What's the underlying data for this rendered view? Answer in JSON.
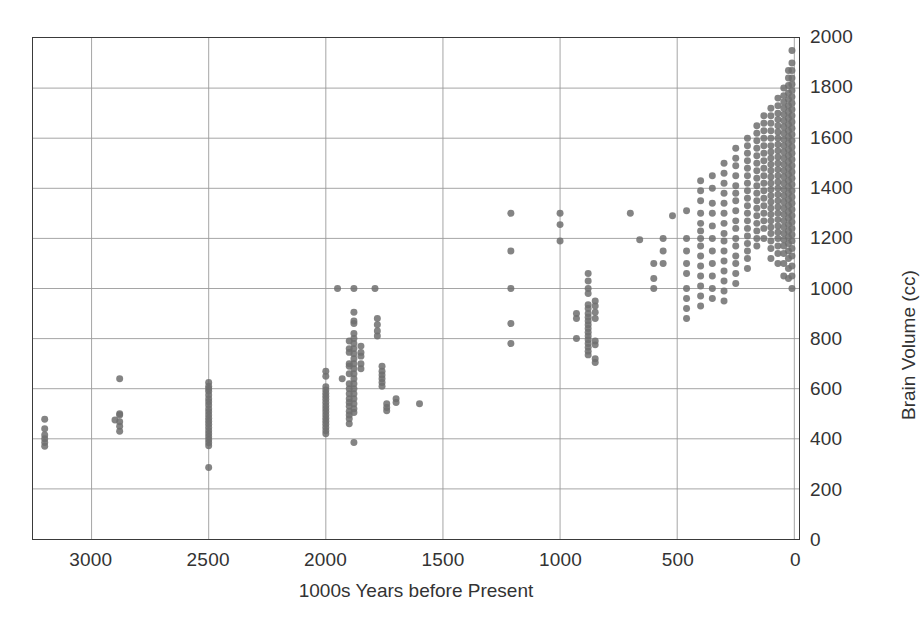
{
  "chart_data": {
    "type": "scatter",
    "title": "",
    "xlabel": "1000s Years before Present",
    "ylabel": "Brain Volume (cc)",
    "xlim": [
      3250,
      -20
    ],
    "ylim": [
      0,
      2000
    ],
    "x_reversed": true,
    "grid": true,
    "legend": "none",
    "marker": {
      "shape": "circle",
      "color": "#6f6f6f",
      "size_px": 7,
      "opacity": 0.85
    },
    "xticks": [
      3000,
      2500,
      2000,
      1500,
      1000,
      500,
      0
    ],
    "xtick_labels": [
      "3000",
      "2500",
      "2000",
      "1500",
      "1000",
      "500",
      "0"
    ],
    "yticks": [
      0,
      200,
      400,
      600,
      800,
      1000,
      1200,
      1400,
      1600,
      1800,
      2000
    ],
    "ytick_labels": [
      "0",
      "200",
      "400",
      "600",
      "800",
      "1000",
      "1200",
      "1400",
      "1600",
      "1800",
      "2000"
    ],
    "ytick_side": "right",
    "points": [
      [
        3200,
        400
      ],
      [
        3200,
        385
      ],
      [
        3200,
        370
      ],
      [
        3200,
        415
      ],
      [
        3200,
        440
      ],
      [
        3200,
        478
      ],
      [
        2900,
        475
      ],
      [
        2880,
        468
      ],
      [
        2880,
        500
      ],
      [
        2880,
        495
      ],
      [
        2880,
        450
      ],
      [
        2880,
        430
      ],
      [
        2880,
        640
      ],
      [
        2500,
        600
      ],
      [
        2500,
        590
      ],
      [
        2500,
        575
      ],
      [
        2500,
        560
      ],
      [
        2500,
        548
      ],
      [
        2500,
        535
      ],
      [
        2500,
        520
      ],
      [
        2500,
        508
      ],
      [
        2500,
        495
      ],
      [
        2500,
        482
      ],
      [
        2500,
        470
      ],
      [
        2500,
        458
      ],
      [
        2500,
        445
      ],
      [
        2500,
        432
      ],
      [
        2500,
        420
      ],
      [
        2500,
        408
      ],
      [
        2500,
        396
      ],
      [
        2500,
        384
      ],
      [
        2500,
        372
      ],
      [
        2500,
        610
      ],
      [
        2500,
        625
      ],
      [
        2500,
        285
      ],
      [
        2000,
        608
      ],
      [
        2000,
        595
      ],
      [
        2000,
        582
      ],
      [
        2000,
        570
      ],
      [
        2000,
        558
      ],
      [
        2000,
        545
      ],
      [
        2000,
        532
      ],
      [
        2000,
        520
      ],
      [
        2000,
        508
      ],
      [
        2000,
        495
      ],
      [
        2000,
        482
      ],
      [
        2000,
        470
      ],
      [
        2000,
        458
      ],
      [
        2000,
        445
      ],
      [
        2000,
        432
      ],
      [
        2000,
        420
      ],
      [
        2000,
        650
      ],
      [
        2000,
        670
      ],
      [
        1950,
        1000
      ],
      [
        1930,
        640
      ],
      [
        1900,
        760
      ],
      [
        1900,
        745
      ],
      [
        1900,
        700
      ],
      [
        1900,
        690
      ],
      [
        1900,
        660
      ],
      [
        1900,
        620
      ],
      [
        1900,
        600
      ],
      [
        1900,
        580
      ],
      [
        1900,
        560
      ],
      [
        1900,
        545
      ],
      [
        1900,
        530
      ],
      [
        1900,
        510
      ],
      [
        1900,
        495
      ],
      [
        1900,
        480
      ],
      [
        1900,
        460
      ],
      [
        1900,
        790
      ],
      [
        1880,
        1000
      ],
      [
        1880,
        905
      ],
      [
        1880,
        870
      ],
      [
        1880,
        820
      ],
      [
        1880,
        800
      ],
      [
        1880,
        780
      ],
      [
        1880,
        760
      ],
      [
        1880,
        740
      ],
      [
        1880,
        720
      ],
      [
        1880,
        700
      ],
      [
        1880,
        680
      ],
      [
        1880,
        660
      ],
      [
        1880,
        640
      ],
      [
        1880,
        620
      ],
      [
        1880,
        600
      ],
      [
        1880,
        580
      ],
      [
        1880,
        560
      ],
      [
        1880,
        540
      ],
      [
        1880,
        520
      ],
      [
        1880,
        505
      ],
      [
        1880,
        860
      ],
      [
        1880,
        385
      ],
      [
        1850,
        770
      ],
      [
        1850,
        745
      ],
      [
        1850,
        730
      ],
      [
        1850,
        700
      ],
      [
        1850,
        680
      ],
      [
        1790,
        1000
      ],
      [
        1780,
        880
      ],
      [
        1780,
        855
      ],
      [
        1780,
        830
      ],
      [
        1780,
        810
      ],
      [
        1760,
        690
      ],
      [
        1760,
        670
      ],
      [
        1760,
        655
      ],
      [
        1760,
        640
      ],
      [
        1760,
        625
      ],
      [
        1760,
        610
      ],
      [
        1740,
        540
      ],
      [
        1740,
        525
      ],
      [
        1740,
        512
      ],
      [
        1700,
        560
      ],
      [
        1700,
        545
      ],
      [
        1600,
        540
      ],
      [
        1210,
        1300
      ],
      [
        1210,
        1150
      ],
      [
        1210,
        1000
      ],
      [
        1210,
        860
      ],
      [
        1210,
        780
      ],
      [
        1000,
        1300
      ],
      [
        1000,
        1255
      ],
      [
        1000,
        1190
      ],
      [
        930,
        900
      ],
      [
        930,
        880
      ],
      [
        930,
        800
      ],
      [
        880,
        1000
      ],
      [
        880,
        980
      ],
      [
        880,
        935
      ],
      [
        880,
        920
      ],
      [
        880,
        900
      ],
      [
        880,
        885
      ],
      [
        880,
        870
      ],
      [
        880,
        855
      ],
      [
        880,
        840
      ],
      [
        880,
        825
      ],
      [
        880,
        810
      ],
      [
        880,
        795
      ],
      [
        880,
        780
      ],
      [
        880,
        765
      ],
      [
        880,
        750
      ],
      [
        880,
        735
      ],
      [
        880,
        1060
      ],
      [
        880,
        1030
      ],
      [
        850,
        950
      ],
      [
        850,
        930
      ],
      [
        850,
        905
      ],
      [
        850,
        880
      ],
      [
        850,
        790
      ],
      [
        850,
        775
      ],
      [
        850,
        720
      ],
      [
        850,
        705
      ],
      [
        700,
        1300
      ],
      [
        660,
        1195
      ],
      [
        600,
        1100
      ],
      [
        600,
        1040
      ],
      [
        600,
        1000
      ],
      [
        560,
        1200
      ],
      [
        560,
        1150
      ],
      [
        560,
        1100
      ],
      [
        520,
        1290
      ],
      [
        460,
        1310
      ],
      [
        460,
        1200
      ],
      [
        460,
        1150
      ],
      [
        460,
        1100
      ],
      [
        460,
        1060
      ],
      [
        460,
        1000
      ],
      [
        460,
        960
      ],
      [
        460,
        920
      ],
      [
        460,
        880
      ],
      [
        400,
        1430
      ],
      [
        400,
        1390
      ],
      [
        400,
        1350
      ],
      [
        400,
        1300
      ],
      [
        400,
        1260
      ],
      [
        400,
        1230
      ],
      [
        400,
        1200
      ],
      [
        400,
        1170
      ],
      [
        400,
        1130
      ],
      [
        400,
        1090
      ],
      [
        400,
        1050
      ],
      [
        400,
        1010
      ],
      [
        400,
        970
      ],
      [
        400,
        930
      ],
      [
        350,
        1450
      ],
      [
        350,
        1400
      ],
      [
        350,
        1340
      ],
      [
        350,
        1300
      ],
      [
        350,
        1250
      ],
      [
        350,
        1200
      ],
      [
        350,
        1150
      ],
      [
        350,
        1100
      ],
      [
        350,
        1050
      ],
      [
        350,
        1000
      ],
      [
        350,
        960
      ],
      [
        300,
        1500
      ],
      [
        300,
        1460
      ],
      [
        300,
        1420
      ],
      [
        300,
        1380
      ],
      [
        300,
        1340
      ],
      [
        300,
        1300
      ],
      [
        300,
        1260
      ],
      [
        300,
        1220
      ],
      [
        300,
        1190
      ],
      [
        300,
        1150
      ],
      [
        300,
        1110
      ],
      [
        300,
        1070
      ],
      [
        300,
        1030
      ],
      [
        300,
        990
      ],
      [
        300,
        950
      ],
      [
        250,
        1560
      ],
      [
        250,
        1520
      ],
      [
        250,
        1490
      ],
      [
        250,
        1450
      ],
      [
        250,
        1410
      ],
      [
        250,
        1380
      ],
      [
        250,
        1350
      ],
      [
        250,
        1310
      ],
      [
        250,
        1270
      ],
      [
        250,
        1240
      ],
      [
        250,
        1200
      ],
      [
        250,
        1170
      ],
      [
        250,
        1130
      ],
      [
        250,
        1100
      ],
      [
        250,
        1060
      ],
      [
        250,
        1020
      ],
      [
        200,
        1600
      ],
      [
        200,
        1570
      ],
      [
        200,
        1540
      ],
      [
        200,
        1510
      ],
      [
        200,
        1480
      ],
      [
        200,
        1450
      ],
      [
        200,
        1420
      ],
      [
        200,
        1390
      ],
      [
        200,
        1360
      ],
      [
        200,
        1330
      ],
      [
        200,
        1300
      ],
      [
        200,
        1270
      ],
      [
        200,
        1240
      ],
      [
        200,
        1210
      ],
      [
        200,
        1180
      ],
      [
        200,
        1150
      ],
      [
        200,
        1120
      ],
      [
        200,
        1080
      ],
      [
        160,
        1650
      ],
      [
        160,
        1620
      ],
      [
        160,
        1590
      ],
      [
        160,
        1560
      ],
      [
        160,
        1530
      ],
      [
        160,
        1500
      ],
      [
        160,
        1470
      ],
      [
        160,
        1440
      ],
      [
        160,
        1410
      ],
      [
        160,
        1380
      ],
      [
        160,
        1350
      ],
      [
        160,
        1320
      ],
      [
        160,
        1290
      ],
      [
        160,
        1260
      ],
      [
        160,
        1230
      ],
      [
        160,
        1200
      ],
      [
        160,
        1170
      ],
      [
        130,
        1690
      ],
      [
        130,
        1660
      ],
      [
        130,
        1630
      ],
      [
        130,
        1600
      ],
      [
        130,
        1570
      ],
      [
        130,
        1540
      ],
      [
        130,
        1510
      ],
      [
        130,
        1480
      ],
      [
        130,
        1450
      ],
      [
        130,
        1420
      ],
      [
        130,
        1390
      ],
      [
        130,
        1360
      ],
      [
        130,
        1330
      ],
      [
        130,
        1300
      ],
      [
        130,
        1270
      ],
      [
        130,
        1240
      ],
      [
        130,
        1200
      ],
      [
        100,
        1720
      ],
      [
        100,
        1690
      ],
      [
        100,
        1660
      ],
      [
        100,
        1630
      ],
      [
        100,
        1600
      ],
      [
        100,
        1570
      ],
      [
        100,
        1545
      ],
      [
        100,
        1520
      ],
      [
        100,
        1495
      ],
      [
        100,
        1470
      ],
      [
        100,
        1445
      ],
      [
        100,
        1420
      ],
      [
        100,
        1395
      ],
      [
        100,
        1370
      ],
      [
        100,
        1345
      ],
      [
        100,
        1320
      ],
      [
        100,
        1295
      ],
      [
        100,
        1270
      ],
      [
        100,
        1245
      ],
      [
        100,
        1220
      ],
      [
        100,
        1190
      ],
      [
        100,
        1160
      ],
      [
        100,
        1120
      ],
      [
        70,
        1760
      ],
      [
        70,
        1730
      ],
      [
        70,
        1700
      ],
      [
        70,
        1675
      ],
      [
        70,
        1650
      ],
      [
        70,
        1625
      ],
      [
        70,
        1600
      ],
      [
        70,
        1575
      ],
      [
        70,
        1550
      ],
      [
        70,
        1525
      ],
      [
        70,
        1500
      ],
      [
        70,
        1475
      ],
      [
        70,
        1450
      ],
      [
        70,
        1425
      ],
      [
        70,
        1400
      ],
      [
        70,
        1375
      ],
      [
        70,
        1350
      ],
      [
        70,
        1325
      ],
      [
        70,
        1300
      ],
      [
        70,
        1275
      ],
      [
        70,
        1250
      ],
      [
        70,
        1225
      ],
      [
        70,
        1200
      ],
      [
        70,
        1170
      ],
      [
        70,
        1140
      ],
      [
        70,
        1100
      ],
      [
        45,
        1800
      ],
      [
        45,
        1770
      ],
      [
        45,
        1745
      ],
      [
        45,
        1720
      ],
      [
        45,
        1695
      ],
      [
        45,
        1670
      ],
      [
        45,
        1645
      ],
      [
        45,
        1620
      ],
      [
        45,
        1595
      ],
      [
        45,
        1570
      ],
      [
        45,
        1545
      ],
      [
        45,
        1520
      ],
      [
        45,
        1495
      ],
      [
        45,
        1470
      ],
      [
        45,
        1445
      ],
      [
        45,
        1420
      ],
      [
        45,
        1395
      ],
      [
        45,
        1370
      ],
      [
        45,
        1345
      ],
      [
        45,
        1320
      ],
      [
        45,
        1295
      ],
      [
        45,
        1270
      ],
      [
        45,
        1245
      ],
      [
        45,
        1220
      ],
      [
        45,
        1195
      ],
      [
        45,
        1170
      ],
      [
        45,
        1140
      ],
      [
        45,
        1100
      ],
      [
        45,
        1050
      ],
      [
        25,
        1870
      ],
      [
        25,
        1840
      ],
      [
        25,
        1810
      ],
      [
        25,
        1780
      ],
      [
        25,
        1755
      ],
      [
        25,
        1730
      ],
      [
        25,
        1705
      ],
      [
        25,
        1680
      ],
      [
        25,
        1655
      ],
      [
        25,
        1630
      ],
      [
        25,
        1605
      ],
      [
        25,
        1580
      ],
      [
        25,
        1555
      ],
      [
        25,
        1530
      ],
      [
        25,
        1505
      ],
      [
        25,
        1480
      ],
      [
        25,
        1455
      ],
      [
        25,
        1430
      ],
      [
        25,
        1405
      ],
      [
        25,
        1380
      ],
      [
        25,
        1355
      ],
      [
        25,
        1330
      ],
      [
        25,
        1305
      ],
      [
        25,
        1280
      ],
      [
        25,
        1255
      ],
      [
        25,
        1230
      ],
      [
        25,
        1205
      ],
      [
        25,
        1180
      ],
      [
        25,
        1150
      ],
      [
        25,
        1120
      ],
      [
        25,
        1080
      ],
      [
        25,
        1040
      ],
      [
        10,
        1950
      ],
      [
        10,
        1900
      ],
      [
        10,
        1870
      ],
      [
        10,
        1840
      ],
      [
        10,
        1815
      ],
      [
        10,
        1790
      ],
      [
        10,
        1765
      ],
      [
        10,
        1740
      ],
      [
        10,
        1715
      ],
      [
        10,
        1690
      ],
      [
        10,
        1665
      ],
      [
        10,
        1640
      ],
      [
        10,
        1615
      ],
      [
        10,
        1590
      ],
      [
        10,
        1565
      ],
      [
        10,
        1540
      ],
      [
        10,
        1515
      ],
      [
        10,
        1490
      ],
      [
        10,
        1465
      ],
      [
        10,
        1440
      ],
      [
        10,
        1415
      ],
      [
        10,
        1390
      ],
      [
        10,
        1365
      ],
      [
        10,
        1340
      ],
      [
        10,
        1315
      ],
      [
        10,
        1290
      ],
      [
        10,
        1265
      ],
      [
        10,
        1240
      ],
      [
        10,
        1215
      ],
      [
        10,
        1190
      ],
      [
        10,
        1160
      ],
      [
        10,
        1130
      ],
      [
        10,
        1090
      ],
      [
        10,
        1050
      ],
      [
        10,
        1000
      ]
    ]
  },
  "colors": {
    "marker": "#6f6f6f",
    "grid": "#9a9a9a",
    "frame": "#3a3a3a",
    "text": "#333333",
    "background": "#ffffff"
  }
}
